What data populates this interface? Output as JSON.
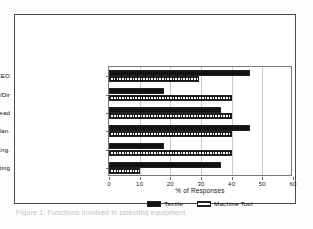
{
  "figure": {
    "caption": "Figure 1. Functions involved in selecting equipment",
    "frame_color": "#4a4a4a"
  },
  "chart_data": {
    "type": "bar",
    "orientation": "horizontal",
    "title": "",
    "xlabel": "% of Responses",
    "ylabel": "",
    "xlim": [
      0,
      60
    ],
    "xticks": [
      0,
      10,
      20,
      30,
      40,
      50,
      60
    ],
    "xtick_labels": [
      "0",
      "10",
      "20",
      "30",
      "40",
      "50",
      "60"
    ],
    "grid": true,
    "legend_position": "bottom-center",
    "categories": [
      "M.D./Pres/CEO",
      "V.P./Dir",
      "Dept/Div. Head",
      "Admin/Plan.",
      "Prod/Eng.",
      "Sales/Marketing"
    ],
    "series": [
      {
        "name": "Textile",
        "pattern": "solid-black",
        "color": "#111111",
        "values": [
          46,
          18,
          36.5,
          46,
          18,
          36.5
        ]
      },
      {
        "name": "Machine Tool",
        "pattern": "crosshatch",
        "color": "#1f1f1f",
        "values": [
          29.5,
          40,
          40,
          40,
          40,
          10
        ]
      }
    ]
  },
  "legend": {
    "items": [
      {
        "label": "Textile"
      },
      {
        "label": "Machine Tool"
      }
    ]
  }
}
